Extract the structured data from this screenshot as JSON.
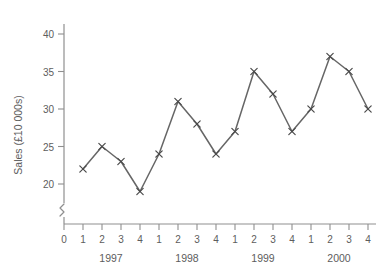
{
  "chart_data": {
    "type": "line",
    "title": "",
    "xlabel": "",
    "ylabel": "Sales (£10 000s)",
    "categories": [
      "1",
      "2",
      "3",
      "4",
      "1",
      "2",
      "3",
      "4",
      "1",
      "2",
      "3",
      "4",
      "1",
      "2",
      "3",
      "4"
    ],
    "group_labels": [
      "1997",
      "1998",
      "1999",
      "2000"
    ],
    "values": [
      22,
      25,
      23,
      19,
      24,
      31,
      28,
      24,
      27,
      35,
      32,
      27,
      30,
      37,
      35,
      30
    ],
    "series": [
      {
        "name": "Sales",
        "values": [
          22,
          25,
          23,
          19,
          24,
          31,
          28,
          24,
          27,
          35,
          32,
          27,
          30,
          37,
          35,
          30
        ]
      }
    ],
    "ylim": [
      20,
      40
    ],
    "yticks": [
      "20",
      "25",
      "30",
      "35",
      "40"
    ],
    "ytick_values": [
      20,
      25,
      30,
      35,
      40
    ],
    "xticks": [
      "0",
      "1",
      "2",
      "3",
      "4",
      "1",
      "2",
      "3",
      "4",
      "1",
      "2",
      "3",
      "4",
      "1",
      "2",
      "3",
      "4"
    ],
    "origin_label": "0",
    "axis_break": true,
    "grid": false,
    "legend": "none",
    "marker": "x-cross",
    "line_color": "#666666",
    "axis_color": "#8f8f8f",
    "text_color": "#5d5d5d",
    "background_color": "#ffffff"
  },
  "axis": {
    "y_label": "Sales (£10 000s)",
    "y_ticks": [
      {
        "label": "40",
        "value": 40
      },
      {
        "label": "35",
        "value": 35
      },
      {
        "label": "30",
        "value": 30
      },
      {
        "label": "25",
        "value": 25
      },
      {
        "label": "20",
        "value": 20
      }
    ],
    "x_origin": "0",
    "x_ticks": [
      "1",
      "2",
      "3",
      "4",
      "1",
      "2",
      "3",
      "4",
      "1",
      "2",
      "3",
      "4",
      "1",
      "2",
      "3",
      "4"
    ],
    "years": [
      "1997",
      "1998",
      "1999",
      "2000"
    ]
  }
}
